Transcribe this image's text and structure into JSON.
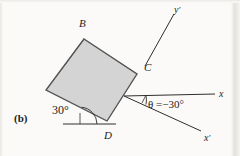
{
  "figure": {
    "panel_label": "(b)",
    "background_color": "#fbfaf8",
    "square": {
      "fill_color": "#d4d4d4",
      "stroke_color": "#3a3a3a",
      "tilt_degrees": 30,
      "vertices": [
        {
          "name": "B",
          "label": "B",
          "x": 84,
          "y": 39
        },
        {
          "name": "C",
          "label": "C",
          "x": 137,
          "y": 74
        },
        {
          "name": "D",
          "label": "D",
          "x": 107,
          "y": 121
        },
        {
          "name": "A",
          "label": "",
          "x": 46,
          "y": 90
        }
      ]
    },
    "vertex_labels": [
      {
        "key": "B",
        "text": "B",
        "x": 79,
        "y": 18
      },
      {
        "key": "C",
        "text": "C",
        "x": 144,
        "y": 62
      },
      {
        "key": "D",
        "text": "D",
        "x": 104,
        "y": 130
      }
    ],
    "axes": [
      {
        "name": "x",
        "label": "x",
        "prime": false,
        "from": {
          "x": 124,
          "y": 96
        },
        "to": {
          "x": 215,
          "y": 94
        },
        "label_pos": {
          "x": 219,
          "y": 89
        }
      },
      {
        "name": "x-prime",
        "label": "x",
        "prime": true,
        "from": {
          "x": 124,
          "y": 96
        },
        "to": {
          "x": 201,
          "y": 131
        },
        "label_pos": {
          "x": 204,
          "y": 133
        }
      },
      {
        "name": "y-prime",
        "label": "y",
        "prime": true,
        "from": {
          "x": 145,
          "y": 66
        },
        "to": {
          "x": 174,
          "y": 14
        },
        "label_pos": {
          "x": 174,
          "y": 5
        }
      }
    ],
    "reference_line": {
      "name": "horizontal-reference",
      "from": {
        "x": 63,
        "y": 124
      },
      "to": {
        "x": 116,
        "y": 124
      }
    },
    "angles": [
      {
        "name": "square-tilt-angle",
        "text": "30°",
        "value": 30,
        "unit": "degrees",
        "label_pos": {
          "x": 52,
          "y": 104
        },
        "vertex": {
          "x": 80,
          "y": 124
        },
        "arc_radius": 17
      },
      {
        "name": "theta-rotation-angle",
        "text": "θ =−30°",
        "symbol": "θ",
        "value": -30,
        "unit": "degrees",
        "label_pos": {
          "x": 148,
          "y": 99
        },
        "vertex": {
          "x": 124,
          "y": 96
        },
        "arc_radius": 22
      }
    ]
  }
}
